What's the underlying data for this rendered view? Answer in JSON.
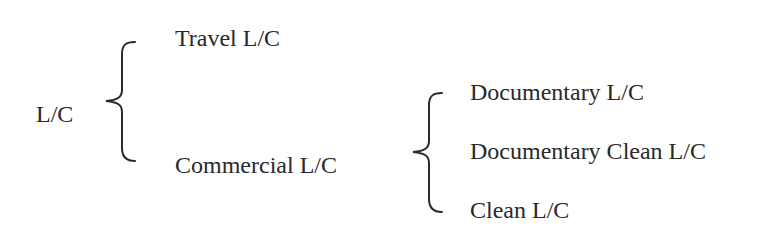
{
  "diagram": {
    "type": "classification-tree",
    "root": {
      "label": "L/C"
    },
    "level1": [
      {
        "label": "Travel L/C"
      },
      {
        "label": "Commercial L/C"
      }
    ],
    "level2": {
      "parent": "Commercial L/C",
      "children": [
        {
          "label": "Documentary L/C"
        },
        {
          "label": "Documentary Clean L/C"
        },
        {
          "label": "Clean L/C"
        }
      ]
    },
    "colors": {
      "text": "#2a2a2a",
      "background": "#ffffff"
    }
  }
}
